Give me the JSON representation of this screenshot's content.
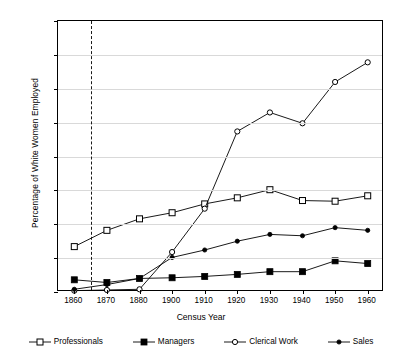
{
  "chart_data": {
    "type": "line",
    "title": "",
    "xlabel": "Census Year",
    "ylabel": "Percentage of White Women Employed",
    "categories": [
      "1860",
      "1870",
      "1880",
      "1900",
      "1910",
      "1920",
      "1930",
      "1940",
      "1950",
      "1960"
    ],
    "ylim": [
      0,
      40
    ],
    "yticks": [
      0,
      5,
      10,
      15,
      20,
      25,
      30,
      35,
      40
    ],
    "grid": true,
    "legend_position": "bottom",
    "annotations": [
      {
        "type": "vertical-dashed-line",
        "x": "1865",
        "label": ""
      }
    ],
    "series": [
      {
        "name": "Professionals",
        "marker": "open-square",
        "values": [
          6.7,
          9.1,
          10.8,
          11.7,
          13.0,
          13.9,
          15.1,
          13.5,
          13.4,
          14.2
        ]
      },
      {
        "name": "Managers",
        "marker": "filled-square",
        "values": [
          1.8,
          1.4,
          2.0,
          2.1,
          2.3,
          2.6,
          3.0,
          3.0,
          4.6,
          4.2
        ]
      },
      {
        "name": "Clerical Work",
        "marker": "open-circle",
        "values": [
          0.2,
          0.3,
          0.4,
          5.9,
          12.3,
          23.7,
          26.5,
          24.9,
          31.0,
          33.9
        ]
      },
      {
        "name": "Sales",
        "marker": "filled-circle",
        "values": [
          0.4,
          1.1,
          2.0,
          5.1,
          6.2,
          7.5,
          8.5,
          8.3,
          9.5,
          9.1
        ]
      }
    ]
  },
  "legend": {
    "items": [
      {
        "label": "Professionals"
      },
      {
        "label": "Managers"
      },
      {
        "label": "Clerical Work"
      },
      {
        "label": "Sales"
      }
    ]
  },
  "colors": {
    "line": "#000000",
    "grid": "#d9d9d9",
    "background": "#ffffff",
    "annotation": "#1a1a1a"
  }
}
